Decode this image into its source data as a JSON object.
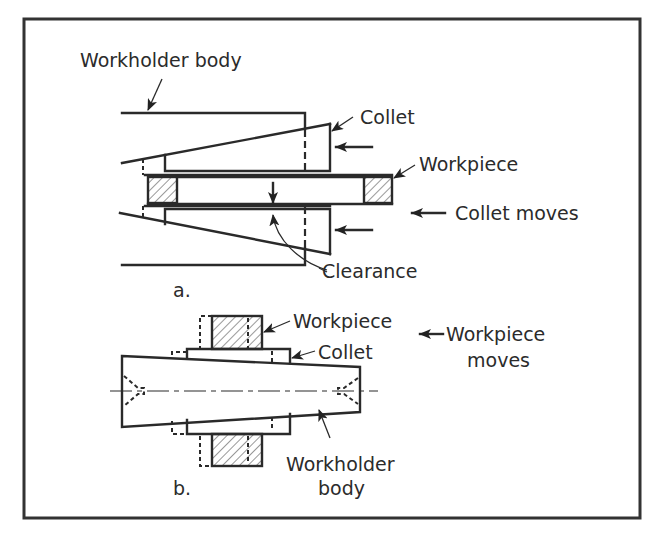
{
  "figure": {
    "frame_color": "#333333",
    "line_color": "#2a2a2a",
    "background": "#ffffff"
  },
  "panel_a": {
    "label": "a.",
    "callouts": {
      "workholder_body": "Workholder body",
      "collet": "Collet",
      "workpiece": "Workpiece",
      "motion": "Collet moves",
      "clearance": "Clearance"
    }
  },
  "panel_b": {
    "label": "b.",
    "callouts": {
      "workpiece": "Workpiece",
      "collet": "Collet",
      "motion_line1": "Workpiece",
      "motion_line2": "moves",
      "workholder_body_line1": "Workholder",
      "workholder_body_line2": "body"
    }
  }
}
